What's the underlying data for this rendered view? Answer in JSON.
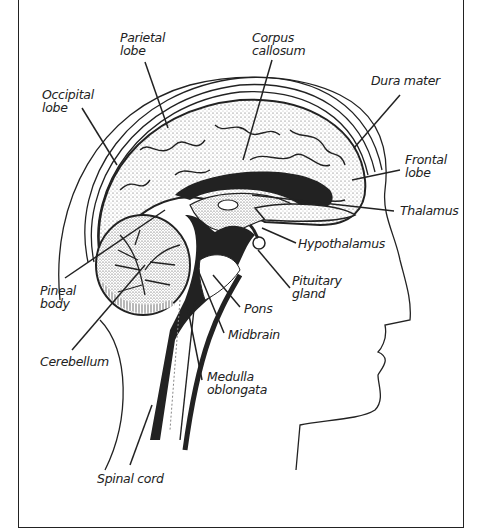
{
  "diagram": {
    "labels": {
      "parietal_lobe": "Parietal\nlobe",
      "corpus_callosum": "Corpus\ncallosum",
      "occipital_lobe": "Occipital\nlobe",
      "dura_mater": "Dura mater",
      "frontal_lobe": "Frontal\nlobe",
      "thalamus": "Thalamus",
      "hypothalamus": "Hypothalamus",
      "pineal_body": "Pineal\nbody",
      "pituitary_gland": "Pituitary\ngland",
      "pons": "Pons",
      "midbrain": "Midbrain",
      "cerebellum": "Cerebellum",
      "medulla_oblongata": "Medulla\noblongata",
      "spinal_cord": "Spinal cord"
    },
    "colors": {
      "ink": "#222222",
      "background": "#ffffff",
      "stipple": "#9a9a9a"
    }
  }
}
